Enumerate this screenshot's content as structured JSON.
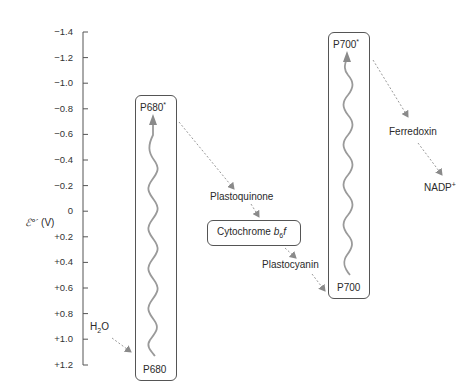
{
  "axis": {
    "label_symbol": "ℰ°′",
    "label_unit": "(V)",
    "ticks": [
      "−1.4",
      "−1.2",
      "−1.0",
      "−0.8",
      "−0.6",
      "−0.4",
      "−0.2",
      "0",
      "+0.2",
      "+0.4",
      "+0.6",
      "+0.8",
      "+1.0",
      "+1.2"
    ],
    "range": [
      -1.4,
      1.2
    ]
  },
  "photosystem2": {
    "excited": "P680",
    "excited_sup": "*",
    "ground": "P680"
  },
  "photosystem1": {
    "excited": "P700",
    "excited_sup": "*",
    "ground": "P700"
  },
  "carriers": {
    "water": "H",
    "water_sub": "2",
    "water_tail": "O",
    "plastoquinone": "Plastoquinone",
    "cytochrome": "Cytochrome ",
    "cytochrome_b": "b",
    "cytochrome_sub": "6",
    "cytochrome_f": "f",
    "plastocyanin": "Plastocyanin",
    "ferredoxin": "Ferredoxin",
    "nadp": "NADP",
    "nadp_sup": "+"
  },
  "colors": {
    "line": "#555555",
    "arrow": "#999999",
    "text": "#2a2a2a"
  }
}
